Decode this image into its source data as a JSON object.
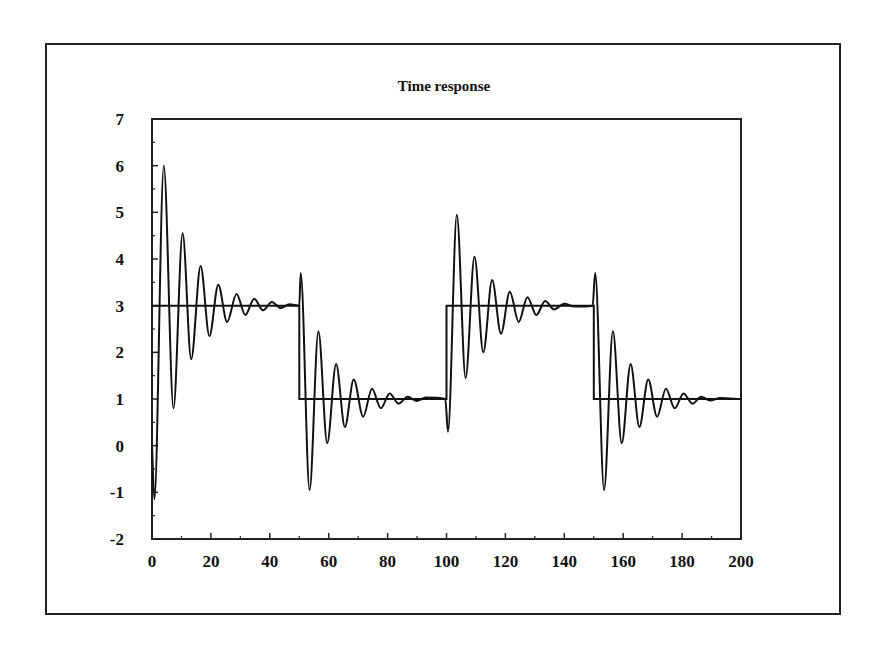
{
  "chart_data": {
    "type": "line",
    "title": "Time response",
    "xlabel": "",
    "ylabel": "",
    "xlim": [
      0,
      200
    ],
    "ylim": [
      -2,
      7
    ],
    "grid": false,
    "legend": null,
    "x_ticks": [
      0,
      20,
      40,
      60,
      80,
      100,
      120,
      140,
      160,
      180,
      200
    ],
    "y_ticks": [
      -2,
      -1,
      0,
      1,
      2,
      3,
      4,
      5,
      6,
      7
    ],
    "series": [
      {
        "name": "Setpoint",
        "style": "step",
        "x": [
          0,
          50,
          50,
          100,
          100,
          150,
          150,
          200
        ],
        "y": [
          3,
          3,
          1,
          1,
          3,
          3,
          1,
          1
        ]
      },
      {
        "name": "Response",
        "style": "smooth",
        "x": [
          0,
          0.8,
          4,
          7.3,
          10.4,
          13.3,
          16.5,
          19.5,
          22.5,
          25.5,
          28.7,
          31.7,
          34.7,
          37.7,
          40.7,
          43.7,
          46.7,
          50,
          50.5,
          53.5,
          56.5,
          59.5,
          62.5,
          65.5,
          68.5,
          71.7,
          74.7,
          77.7,
          80.7,
          83.7,
          86.8,
          89.8,
          93,
          99.6,
          100.5,
          103.5,
          106.5,
          109.5,
          112.5,
          115.5,
          118.5,
          121.5,
          124.5,
          127.5,
          130.5,
          133.5,
          136.5,
          140,
          143.5,
          149.6,
          150.5,
          153.5,
          156.5,
          159.5,
          162.5,
          165.5,
          168.5,
          171.5,
          174.5,
          177.5,
          180.5,
          183.5,
          186.5,
          189.5,
          193,
          200
        ],
        "y": [
          0,
          -1.15,
          6.0,
          0.8,
          4.55,
          1.85,
          3.85,
          2.35,
          3.45,
          2.65,
          3.25,
          2.8,
          3.15,
          2.9,
          3.08,
          2.95,
          3.03,
          3.0,
          3.7,
          -0.95,
          2.45,
          0.05,
          1.75,
          0.4,
          1.42,
          0.62,
          1.22,
          0.8,
          1.12,
          0.9,
          1.05,
          0.96,
          1.03,
          1.0,
          0.3,
          4.95,
          1.45,
          4.05,
          2.0,
          3.55,
          2.4,
          3.3,
          2.65,
          3.18,
          2.8,
          3.1,
          2.92,
          3.04,
          2.98,
          3.0,
          3.7,
          -0.95,
          2.45,
          0.05,
          1.75,
          0.4,
          1.42,
          0.62,
          1.22,
          0.8,
          1.12,
          0.9,
          1.05,
          0.97,
          1.02,
          1.0
        ]
      }
    ]
  },
  "colors": {
    "line": "#111111",
    "axes": "#222222",
    "background": "#ffffff"
  }
}
